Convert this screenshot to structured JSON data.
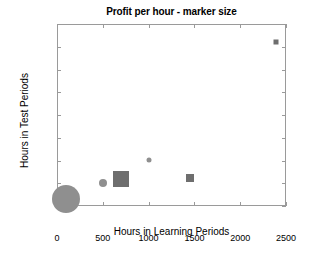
{
  "chart_data": {
    "type": "scatter",
    "title": "Profit per hour - marker size",
    "xlabel": "Hours in Learning Periods",
    "ylabel": "Hours in Test Periods",
    "xlim": [
      0,
      2500
    ],
    "ylim": [
      0,
      800
    ],
    "xticks": [
      0,
      500,
      1000,
      1500,
      2000,
      2500
    ],
    "yticks": [
      0,
      100,
      200,
      300,
      400,
      500,
      600,
      700,
      800
    ],
    "grid": false,
    "legend": null,
    "size_encodes": "profit per hour",
    "points": [
      {
        "x": 100,
        "y": 30,
        "size_px": 28,
        "shape": "circle",
        "color": "#8f8f8f"
      },
      {
        "x": 500,
        "y": 100,
        "size_px": 8,
        "shape": "circle",
        "color": "#8f8f8f"
      },
      {
        "x": 700,
        "y": 120,
        "size_px": 16,
        "shape": "square",
        "color": "#6e6e6e"
      },
      {
        "x": 1000,
        "y": 203,
        "size_px": 5,
        "shape": "circle",
        "color": "#8f8f8f"
      },
      {
        "x": 1450,
        "y": 122,
        "size_px": 8,
        "shape": "square",
        "color": "#6e6e6e"
      },
      {
        "x": 2390,
        "y": 722,
        "size_px": 5,
        "shape": "square",
        "color": "#6e6e6e"
      }
    ]
  },
  "colors": {
    "axis": "#9a9a9a",
    "text": "#000000",
    "background": "#ffffff",
    "marker_circle": "#8f8f8f",
    "marker_square": "#6e6e6e"
  }
}
